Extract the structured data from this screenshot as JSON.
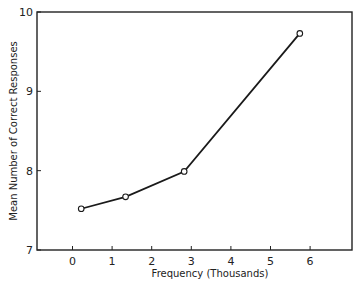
{
  "chart_data": {
    "type": "line",
    "title": "",
    "xlabel": "Frequency (Thousands)",
    "ylabel": "Mean Number of Correct Responses",
    "xlim": [
      -0.8,
      7.0
    ],
    "ylim": [
      7,
      10
    ],
    "x_ticks": [
      0,
      1,
      2,
      3,
      4,
      5,
      6
    ],
    "y_ticks": [
      7,
      8,
      9,
      10
    ],
    "grid": false,
    "legend": null,
    "series": [
      {
        "name": "Mean correct responses",
        "marker": "open-circle",
        "x": [
          0.22,
          1.34,
          2.82,
          5.74
        ],
        "y": [
          7.52,
          7.67,
          7.99,
          9.73
        ]
      }
    ]
  },
  "axes": {
    "x_tick_labels": [
      "0",
      "1",
      "2",
      "3",
      "4",
      "5",
      "6"
    ],
    "y_tick_labels": [
      "7",
      "8",
      "9",
      "10"
    ]
  }
}
